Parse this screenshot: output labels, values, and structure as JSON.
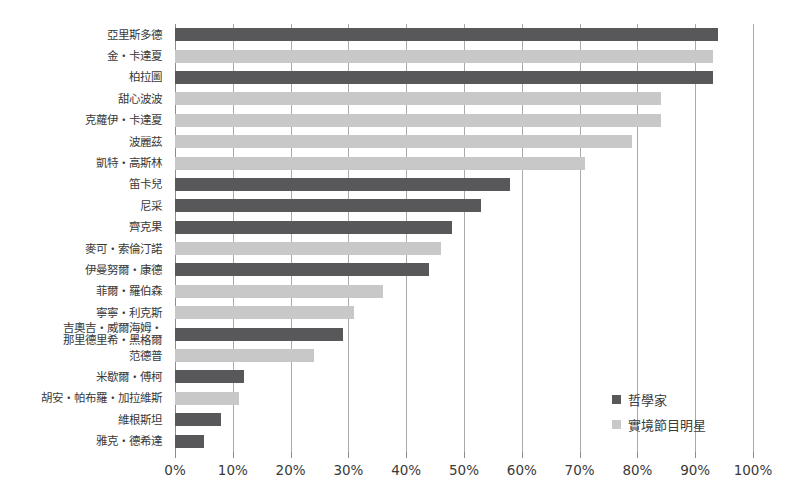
{
  "chart_data": {
    "type": "bar",
    "orientation": "horizontal",
    "title": "",
    "xlabel": "",
    "ylabel": "",
    "xlim": [
      0,
      100
    ],
    "xticks": [
      "0%",
      "10%",
      "20%",
      "30%",
      "40%",
      "50%",
      "60%",
      "70%",
      "80%",
      "90%",
      "100%"
    ],
    "xtick_values": [
      0,
      10,
      20,
      30,
      40,
      50,
      60,
      70,
      80,
      90,
      100
    ],
    "grid": true,
    "legend_position": "bottom-right",
    "series": [
      {
        "name": "哲學家",
        "color": "#58585a",
        "key": "philosopher"
      },
      {
        "name": "實境節目明星",
        "color": "#c8c8c8",
        "key": "reality"
      }
    ],
    "categories": [
      "亞里斯多德",
      "金・卡達夏",
      "柏拉圖",
      "甜心波波",
      "克蘿伊・卡達夏",
      "波麗茲",
      "凱特・高斯林",
      "笛卡兒",
      "尼采",
      "齊克果",
      "麥可・索倫汀諾",
      "伊曼努爾・康德",
      "菲爾・羅伯森",
      "寧寧・利克斯",
      "吉奧吉・威爾海姆・\n那里德里希・黑格爾",
      "范德普",
      "米歇爾・傅柯",
      "胡安・帕布羅・加拉維斯",
      "維根斯坦",
      "雅克・德希達"
    ],
    "bars": [
      {
        "label": "亞里斯多德",
        "value": 94,
        "group": "philosopher"
      },
      {
        "label": "金・卡達夏",
        "value": 93,
        "group": "reality"
      },
      {
        "label": "柏拉圖",
        "value": 93,
        "group": "philosopher"
      },
      {
        "label": "甜心波波",
        "value": 84,
        "group": "reality"
      },
      {
        "label": "克蘿伊・卡達夏",
        "value": 84,
        "group": "reality"
      },
      {
        "label": "波麗茲",
        "value": 79,
        "group": "reality"
      },
      {
        "label": "凱特・高斯林",
        "value": 71,
        "group": "reality"
      },
      {
        "label": "笛卡兒",
        "value": 58,
        "group": "philosopher"
      },
      {
        "label": "尼采",
        "value": 53,
        "group": "philosopher"
      },
      {
        "label": "齊克果",
        "value": 48,
        "group": "philosopher"
      },
      {
        "label": "麥可・索倫汀諾",
        "value": 46,
        "group": "reality"
      },
      {
        "label": "伊曼努爾・康德",
        "value": 44,
        "group": "philosopher"
      },
      {
        "label": "菲爾・羅伯森",
        "value": 36,
        "group": "reality"
      },
      {
        "label": "寧寧・利克斯",
        "value": 31,
        "group": "reality"
      },
      {
        "label": "吉奧吉・威爾海姆・\n那里德里希・黑格爾",
        "value": 29,
        "group": "philosopher"
      },
      {
        "label": "范德普",
        "value": 24,
        "group": "reality"
      },
      {
        "label": "米歇爾・傅柯",
        "value": 12,
        "group": "philosopher"
      },
      {
        "label": "胡安・帕布羅・加拉維斯",
        "value": 11,
        "group": "reality"
      },
      {
        "label": "維根斯坦",
        "value": 8,
        "group": "philosopher"
      },
      {
        "label": "雅克・德希達",
        "value": 5,
        "group": "philosopher"
      }
    ]
  }
}
